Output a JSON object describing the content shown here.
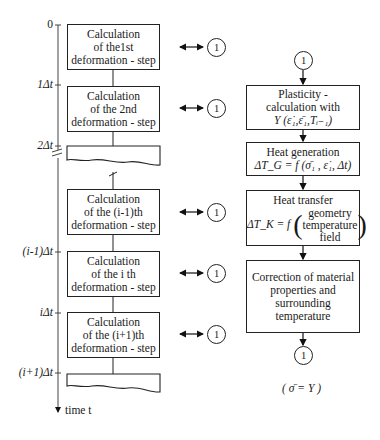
{
  "axis": {
    "ticks": [
      "0",
      "1Δt",
      "2Δt",
      "(i-1)Δt",
      "iΔt",
      "(i+1)Δt"
    ],
    "label": "time t"
  },
  "left_boxes": [
    {
      "line1": "Calculation",
      "line2": "of the1st",
      "line3": "deformation - step"
    },
    {
      "line1": "Calculation",
      "line2": "of the 2nd",
      "line3": "deformation - step"
    },
    {
      "line1": "Calculation",
      "line2": "of the (i-1)th",
      "line3": "deformation - step"
    },
    {
      "line1": "Calculation",
      "line2": "of the i th",
      "line3": "deformation - step"
    },
    {
      "line1": "Calculation",
      "line2": "of the (i+1)th",
      "line3": "deformation - step"
    }
  ],
  "connector_label": "1",
  "right_flow": {
    "start_connector": "1",
    "plasticity": {
      "line1": "Plasticity -",
      "line2": "calculation with",
      "line3": "Y (ε̇₁,ε̄₁,Tᵢ₋₁)"
    },
    "heat_generation": {
      "line1": "Heat generation",
      "line2": "ΔT_G = f (σ̄₁ , ε̇₁, Δt)"
    },
    "heat_transfer": {
      "title": "Heat transfer",
      "lhs": "ΔT_K = f",
      "args": [
        "geometry",
        "temperature",
        "field"
      ]
    },
    "correction": {
      "line1": "Correction of material",
      "line2": "properties and",
      "line3": "surrounding",
      "line4": "temperature"
    },
    "end_connector": "1",
    "condition": "( σ̄ = Y )"
  }
}
